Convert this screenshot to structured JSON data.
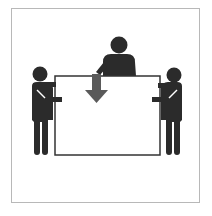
{
  "pictogram": {
    "subject": "three-person-lift",
    "colors": {
      "figure": "#2b2b2b",
      "arrow": "#5a5a5a",
      "board_stroke": "#333333",
      "frame_border": "#b8b8b8",
      "background": "#ffffff"
    },
    "elements": {
      "left_person": "person-icon",
      "center_person": "person-icon",
      "right_person": "person-icon",
      "board": "panel-icon",
      "arrow": "arrow-down-icon"
    }
  }
}
